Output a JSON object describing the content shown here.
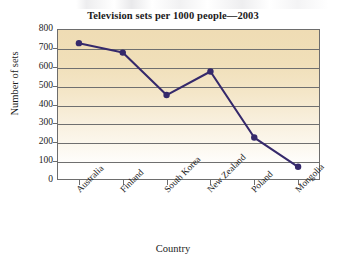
{
  "chart_data": {
    "type": "line",
    "title": "Television sets per 1000 people—2003",
    "xlabel": "Country",
    "ylabel": "Number of sets",
    "categories": [
      "Australia",
      "Finland",
      "South Korea",
      "New Zealand",
      "Poland",
      "Mongolia"
    ],
    "values": [
      725,
      675,
      450,
      575,
      225,
      70
    ],
    "series": [
      {
        "name": "Television sets per 1000 people",
        "values": [
          725,
          675,
          450,
          575,
          225,
          70
        ]
      }
    ],
    "ylim": [
      0,
      800
    ],
    "ytick_step": 100,
    "yticks": [
      800,
      700,
      600,
      500,
      400,
      300,
      200,
      100,
      0
    ],
    "grid": "horizontal",
    "legend": "none",
    "marker": "filled-circle",
    "line_color": "#35296b",
    "marker_color": "#35296b",
    "plot_background_top_color": "#efdcb4",
    "plot_background_bottom_color": "#ffffff",
    "gridline_color": "#6f6f6f",
    "axis_color": "#6d6d6d",
    "text_color": "#1b1b1b"
  }
}
